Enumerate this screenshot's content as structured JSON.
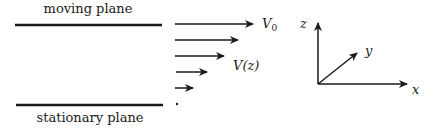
{
  "diagram": {
    "planes": {
      "moving": {
        "label": "moving plane"
      },
      "stationary": {
        "label": "stationary plane"
      }
    },
    "velocity_profile": {
      "top_label_main": "V",
      "top_label_sub": "0",
      "mid_label": "V(z)",
      "arrows_relative_length": [
        1.0,
        0.8,
        0.6,
        0.4,
        0.2,
        0.0
      ]
    },
    "axes": {
      "x_label": "x",
      "y_label": "y",
      "z_label": "z"
    },
    "colors": {
      "ink": "#1a1a1a",
      "background": "#ffffff"
    }
  }
}
